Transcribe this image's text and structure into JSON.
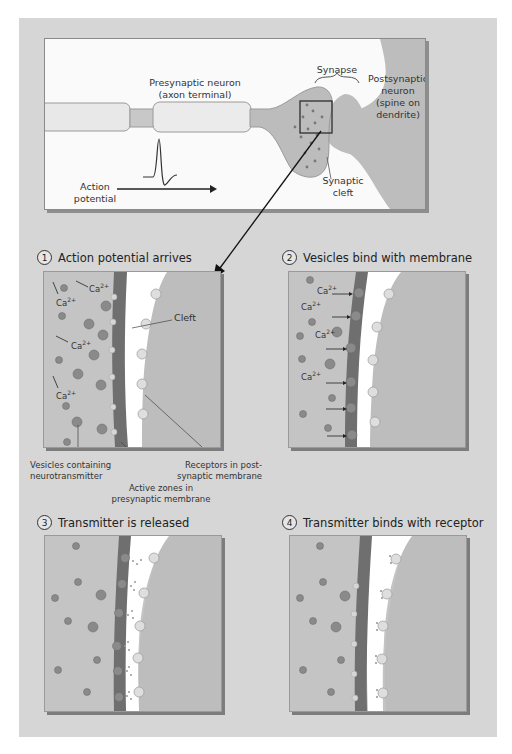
{
  "overview": {
    "presynaptic_label": "Presynaptic neuron\n(axon terminal)",
    "synapse_label": "Synapse",
    "postsynaptic_label": "Postsynaptic\nneuron\n(spine on\ndendrite)",
    "synaptic_cleft_label": "Synaptic\ncleft",
    "action_potential_label": "Action\npotential"
  },
  "steps": [
    {
      "number": "1",
      "title": "Action potential arrives"
    },
    {
      "number": "2",
      "title": "Vesicles bind with membrane"
    },
    {
      "number": "3",
      "title": "Transmitter is released"
    },
    {
      "number": "4",
      "title": "Transmitter binds with receptor"
    }
  ],
  "panel1": {
    "cleft_label": "Cleft",
    "ion_label": "Ca",
    "ion_charge": "2+",
    "vesicles_label": "Vesicles containing\nneurotransmitter",
    "active_zones_label": "Active zones in\npresynaptic membrane",
    "receptors_label": "Receptors in post-\nsynaptic membrane"
  },
  "panel2": {
    "ion_label": "Ca",
    "ion_charge": "2+"
  },
  "colors": {
    "page_bg": "#d6d6d6",
    "panel_bg": "#c4c4c4",
    "membrane": "#6f6f6f",
    "cleft": "#ffffff",
    "post_cell": "#bdbdbd",
    "vesicle": "#8a8a8a",
    "receptor": "#dcdcdc"
  }
}
